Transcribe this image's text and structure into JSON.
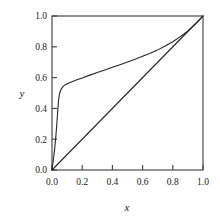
{
  "chart_data": {
    "type": "line",
    "title": "",
    "xlabel": "x",
    "ylabel": "y",
    "xlim": [
      0.0,
      1.0
    ],
    "ylim": [
      0.0,
      1.0
    ],
    "grid": false,
    "legend": "none",
    "xticks": [
      "0.0",
      "0.2",
      "0.4",
      "0.6",
      "0.8",
      "1.0"
    ],
    "xtick_values": [
      0.0,
      0.2,
      0.4,
      0.6,
      0.8,
      1.0
    ],
    "yticks": [
      "0.0",
      "0.2",
      "0.4",
      "0.6",
      "0.8",
      "1.0"
    ],
    "ytick_values": [
      0.0,
      0.2,
      0.4,
      0.6,
      0.8,
      1.0
    ],
    "tick_direction": "in",
    "line_color": "#262626",
    "frame_color": "#3b3b3b",
    "background": "#ffffff",
    "series": [
      {
        "name": "knee-curve",
        "x": [
          0.0,
          0.004,
          0.01,
          0.018,
          0.026,
          0.032,
          0.036,
          0.04,
          0.043,
          0.046,
          0.05,
          0.055,
          0.062,
          0.07,
          0.08,
          0.092,
          0.105,
          0.12,
          0.14,
          0.17,
          0.2,
          0.25,
          0.3,
          0.35,
          0.4,
          0.45,
          0.5,
          0.55,
          0.6,
          0.65,
          0.7,
          0.75,
          0.8,
          0.85,
          0.9,
          0.95,
          0.975,
          1.0
        ],
        "y": [
          0.0,
          0.03,
          0.075,
          0.14,
          0.225,
          0.3,
          0.355,
          0.41,
          0.448,
          0.472,
          0.495,
          0.512,
          0.527,
          0.538,
          0.548,
          0.556,
          0.562,
          0.568,
          0.576,
          0.588,
          0.598,
          0.616,
          0.633,
          0.65,
          0.667,
          0.684,
          0.701,
          0.719,
          0.738,
          0.758,
          0.78,
          0.805,
          0.833,
          0.866,
          0.903,
          0.948,
          0.973,
          1.0
        ]
      },
      {
        "name": "diagonal-reference",
        "x": [
          0.0,
          1.0
        ],
        "y": [
          0.0,
          1.0
        ]
      }
    ]
  },
  "axes": {
    "xlabel": "x",
    "ylabel": "y"
  }
}
